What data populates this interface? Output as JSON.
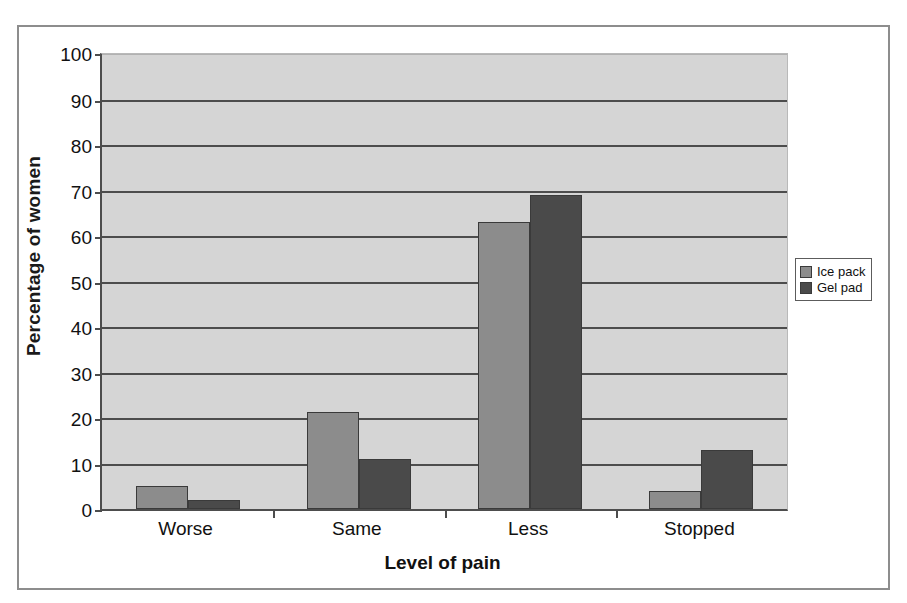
{
  "chart_data": {
    "type": "bar",
    "title": "",
    "subtitle": "",
    "xlabel": "Level of pain",
    "ylabel": "Percentage of women",
    "categories": [
      "Worse",
      "Same",
      "Less",
      "Stopped"
    ],
    "series": [
      {
        "name": "Ice pack",
        "color": "#8c8c8c",
        "values": [
          5,
          21.3,
          63,
          4
        ]
      },
      {
        "name": "Gel pad",
        "color": "#4a4a4a",
        "values": [
          2,
          11,
          69,
          13
        ]
      }
    ],
    "ylim": [
      0,
      100
    ],
    "ytick_step": 10,
    "yticks": [
      100,
      90,
      80,
      70,
      60,
      50,
      40,
      30,
      20,
      10,
      0
    ],
    "grid": true,
    "grid_axis": "y",
    "legend_position": "right",
    "plot_background": "#d5d5d5",
    "axis_color": "#4d4d4d"
  },
  "legend": {
    "items": [
      {
        "label": "Ice pack",
        "swatch": "#8c8c8c"
      },
      {
        "label": "Gel pad",
        "swatch": "#4a4a4a"
      }
    ]
  }
}
